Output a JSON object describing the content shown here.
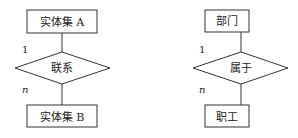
{
  "left": {
    "top_entity": "实体集 A",
    "relation": "联系",
    "bottom_entity": "实体集 B",
    "card_top": "1",
    "card_bottom": "n"
  },
  "right": {
    "top_entity": "部门",
    "relation": "属于",
    "bottom_entity": "职工",
    "card_top": "1",
    "card_bottom": "n"
  }
}
